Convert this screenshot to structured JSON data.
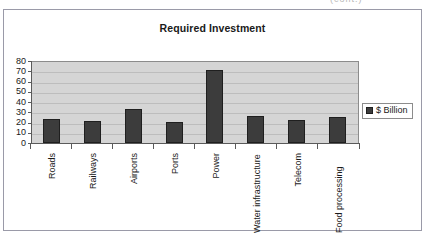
{
  "chart_data": {
    "type": "bar",
    "title": "Required Investment",
    "xlabel": "",
    "ylabel": "",
    "categories": [
      "Roads",
      "Railways",
      "Airports",
      "Ports",
      "Power",
      "Water infrastructure",
      "Telecom",
      "Food processing"
    ],
    "series": [
      {
        "name": "$ Billion",
        "values": [
          23,
          21,
          33,
          20.5,
          71,
          26,
          22,
          25
        ],
        "color": "#3c3c3c"
      }
    ],
    "values": [
      23,
      21,
      33,
      20.5,
      71,
      26,
      22,
      25
    ],
    "ylim": [
      0,
      80
    ],
    "ytick_labels": [
      "80",
      "70",
      "60",
      "50",
      "40",
      "30",
      "20",
      "10",
      "0"
    ],
    "ytick_values": [
      80,
      70,
      60,
      50,
      40,
      30,
      20,
      10,
      0
    ],
    "grid": true,
    "grid_axis": "y",
    "legend_position": "right",
    "legend_entries": [
      "$ Billion"
    ],
    "plot_background": "#d5d5d5",
    "bar_color": "#3c3c3c"
  },
  "legend": {
    "label": "$ Billion",
    "swatch_icon": "legend-square-swatch"
  },
  "artifact": {
    "top_right_text": "(cont.)"
  }
}
